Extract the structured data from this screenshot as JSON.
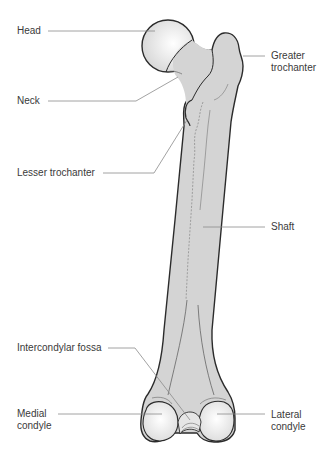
{
  "diagram": {
    "colors": {
      "bone_fill": "#d4d4d4",
      "articular_fill": "#f0f0f0",
      "outline": "#2b2b2b",
      "leader_line": "#8a8a8a",
      "text": "#3a3a3a",
      "background": "#ffffff"
    },
    "labels": [
      {
        "id": "head",
        "text": "Head",
        "line2": ""
      },
      {
        "id": "greater-trochanter",
        "text": "Greater",
        "line2": "trochanter"
      },
      {
        "id": "neck",
        "text": "Neck",
        "line2": ""
      },
      {
        "id": "lesser-trochanter",
        "text": "Lesser trochanter",
        "line2": ""
      },
      {
        "id": "shaft",
        "text": "Shaft",
        "line2": ""
      },
      {
        "id": "intercondylar-fossa",
        "text": "Intercondylar fossa",
        "line2": ""
      },
      {
        "id": "medial-condyle",
        "text": "Medial",
        "line2": "condyle"
      },
      {
        "id": "lateral-condyle",
        "text": "Lateral",
        "line2": "condyle"
      }
    ]
  }
}
